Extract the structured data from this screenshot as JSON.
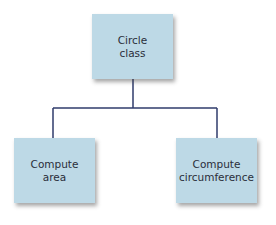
{
  "diagram": {
    "line_color": "#2f3b6b",
    "box_color": "#bdd9e6",
    "nodes": {
      "root": {
        "lines": [
          "Circle",
          "class"
        ]
      },
      "left": {
        "lines": [
          "Compute",
          "area"
        ]
      },
      "right": {
        "lines": [
          "Compute",
          "circumference"
        ]
      }
    },
    "edges": [
      {
        "from": "root",
        "to": "left"
      },
      {
        "from": "root",
        "to": "right"
      }
    ]
  }
}
